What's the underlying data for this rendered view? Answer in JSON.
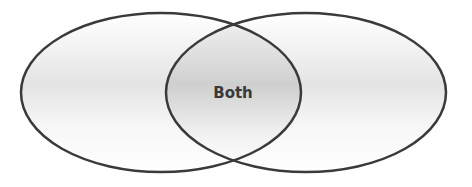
{
  "diagram": {
    "type": "venn",
    "sets": [
      {
        "name": "left-set",
        "label": ""
      },
      {
        "name": "right-set",
        "label": ""
      }
    ],
    "intersection_label": "Both",
    "colors": {
      "stroke": "#3a3a3a",
      "fill_light": "#ffffff",
      "fill_shade": "#d9d9d9",
      "text": "#3a3a3a"
    }
  }
}
